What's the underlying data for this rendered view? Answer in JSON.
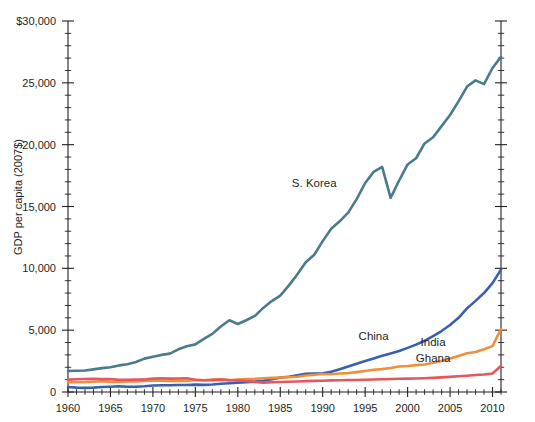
{
  "chart_data": {
    "type": "line",
    "title": "",
    "xlabel": "",
    "ylabel": "GDP per capita (2007$)",
    "xlim": [
      1960,
      2011
    ],
    "ylim": [
      0,
      30000
    ],
    "grid": false,
    "legend_position": "inline-labels",
    "x_ticks": [
      1960,
      1965,
      1970,
      1975,
      1980,
      1985,
      1990,
      1995,
      2000,
      2005,
      2010
    ],
    "x_tick_labels": [
      "1960",
      "1965",
      "1970",
      "1975",
      "1980",
      "1985",
      "1990",
      "1995",
      "2000",
      "2005",
      "2010"
    ],
    "x_minor_step": 1,
    "y_ticks": [
      0,
      5000,
      10000,
      15000,
      20000,
      25000,
      30000
    ],
    "y_tick_labels": [
      "0",
      "5,000",
      "10,000",
      "15,000",
      "20,000",
      "25,000",
      "$30,000"
    ],
    "y_minor_step": 1000,
    "x": [
      1960,
      1961,
      1962,
      1963,
      1964,
      1965,
      1966,
      1967,
      1968,
      1969,
      1970,
      1971,
      1972,
      1973,
      1974,
      1975,
      1976,
      1977,
      1978,
      1979,
      1980,
      1981,
      1982,
      1983,
      1984,
      1985,
      1986,
      1987,
      1988,
      1989,
      1990,
      1991,
      1992,
      1993,
      1994,
      1995,
      1996,
      1997,
      1998,
      1999,
      2000,
      2001,
      2002,
      2003,
      2004,
      2005,
      2006,
      2007,
      2008,
      2009,
      2010,
      2011
    ],
    "series": [
      {
        "name": "S. Korea",
        "color": "#4a7b8c",
        "label_x": 1989,
        "label_y": 16600,
        "values": [
          1700,
          1720,
          1740,
          1830,
          1930,
          2000,
          2150,
          2250,
          2430,
          2700,
          2850,
          3000,
          3100,
          3450,
          3700,
          3850,
          4300,
          4700,
          5300,
          5800,
          5500,
          5800,
          6150,
          6800,
          7350,
          7800,
          8600,
          9500,
          10500,
          11100,
          12200,
          13200,
          13800,
          14500,
          15600,
          16900,
          17800,
          18200,
          15700,
          17100,
          18400,
          18900,
          20100,
          20600,
          21500,
          22400,
          23500,
          24700,
          25200,
          24900,
          26200,
          27100
        ]
      },
      {
        "name": "China",
        "color": "#3b5fb0",
        "label_x": 1996,
        "label_y": 4200,
        "values": [
          400,
          350,
          330,
          350,
          400,
          430,
          460,
          430,
          420,
          460,
          520,
          540,
          540,
          570,
          570,
          600,
          580,
          610,
          670,
          710,
          760,
          790,
          840,
          910,
          1030,
          1160,
          1240,
          1350,
          1470,
          1490,
          1510,
          1630,
          1840,
          2060,
          2290,
          2500,
          2710,
          2930,
          3120,
          3320,
          3570,
          3830,
          4140,
          4510,
          4930,
          5420,
          6000,
          6760,
          7370,
          8000,
          8800,
          9900
        ]
      },
      {
        "name": "India",
        "color": "#ef8f3c",
        "label_x": 2003,
        "label_y": 3700,
        "values": [
          800,
          790,
          800,
          830,
          870,
          820,
          810,
          850,
          860,
          900,
          940,
          920,
          890,
          900,
          890,
          970,
          950,
          1000,
          1030,
          950,
          1010,
          1050,
          1060,
          1110,
          1140,
          1170,
          1200,
          1230,
          1340,
          1400,
          1460,
          1440,
          1490,
          1530,
          1610,
          1700,
          1800,
          1850,
          1940,
          2060,
          2100,
          2170,
          2220,
          2370,
          2510,
          2700,
          2910,
          3140,
          3230,
          3460,
          3710,
          5100
        ]
      },
      {
        "name": "Ghana",
        "color": "#e4575c",
        "label_x": 2003,
        "label_y": 2450,
        "values": [
          1000,
          1030,
          1050,
          1060,
          1040,
          1040,
          980,
          980,
          1000,
          1010,
          1080,
          1110,
          1080,
          1090,
          1110,
          990,
          950,
          960,
          1000,
          960,
          950,
          890,
          820,
          760,
          790,
          810,
          830,
          850,
          880,
          900,
          910,
          940,
          950,
          970,
          970,
          990,
          1010,
          1030,
          1050,
          1070,
          1080,
          1090,
          1110,
          1140,
          1180,
          1220,
          1270,
          1320,
          1380,
          1420,
          1500,
          2100
        ]
      }
    ]
  }
}
